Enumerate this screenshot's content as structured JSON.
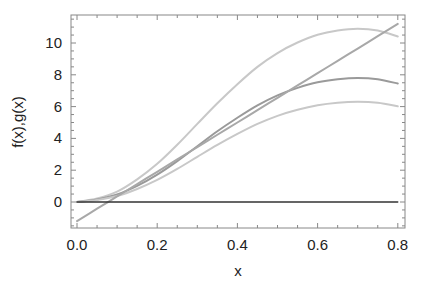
{
  "chart_data": {
    "type": "line",
    "title": "",
    "xlabel": "x",
    "ylabel": "f(x),g(x)",
    "xlim": [
      -0.015,
      0.815
    ],
    "ylim": [
      -1.6,
      11.8
    ],
    "xticks": [
      0.0,
      0.2,
      0.4,
      0.6,
      0.8
    ],
    "xtick_labels": [
      "0.0",
      "0.2",
      "0.4",
      "0.6",
      "0.8"
    ],
    "yticks": [
      0,
      2,
      4,
      6,
      8,
      10
    ],
    "ytick_labels": [
      "0",
      "2",
      "4",
      "6",
      "8",
      "10"
    ],
    "grid": false,
    "legend": null,
    "x": [
      0,
      0.05,
      0.1,
      0.15,
      0.2,
      0.25,
      0.3,
      0.35,
      0.4,
      0.45,
      0.5,
      0.55,
      0.6,
      0.65,
      0.7,
      0.75,
      0.8
    ],
    "series": [
      {
        "name": "curve-top",
        "color": "#c8c8c8",
        "width": 2,
        "values": [
          0,
          0.22,
          0.65,
          1.42,
          2.4,
          3.6,
          4.91,
          6.21,
          7.41,
          8.5,
          9.37,
          10.03,
          10.52,
          10.79,
          10.9,
          10.79,
          10.41
        ]
      },
      {
        "name": "curve-middle",
        "color": "#9a9a9a",
        "width": 2,
        "values": [
          0,
          0.16,
          0.47,
          1.01,
          1.72,
          2.57,
          3.51,
          4.45,
          5.3,
          6.08,
          6.71,
          7.18,
          7.53,
          7.72,
          7.8,
          7.72,
          7.45
        ]
      },
      {
        "name": "curve-bottom",
        "color": "#c8c8c8",
        "width": 2,
        "values": [
          0,
          0.13,
          0.38,
          0.82,
          1.39,
          2.08,
          2.84,
          3.59,
          4.28,
          4.91,
          5.42,
          5.8,
          6.08,
          6.24,
          6.3,
          6.24,
          6.02
        ]
      },
      {
        "name": "line-linear",
        "color": "#a8a8a8",
        "width": 2,
        "values": [
          -1.2,
          -0.42,
          0.35,
          1.13,
          1.9,
          2.68,
          3.45,
          4.23,
          5.0,
          5.78,
          6.55,
          7.33,
          8.1,
          8.88,
          9.65,
          10.43,
          11.2
        ]
      },
      {
        "name": "zero-line",
        "color": "#333333",
        "width": 1.3,
        "values": [
          0,
          0,
          0,
          0,
          0,
          0,
          0,
          0,
          0,
          0,
          0,
          0,
          0,
          0,
          0,
          0,
          0
        ]
      }
    ],
    "frame_color": "#888888"
  }
}
